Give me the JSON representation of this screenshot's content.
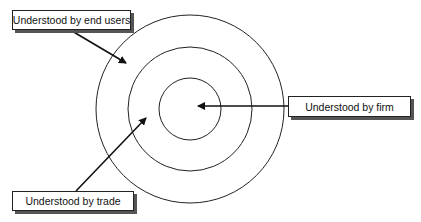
{
  "diagram": {
    "type": "concentric-circles",
    "center": [
      190,
      109
    ],
    "radii": [
      31,
      62,
      94
    ],
    "stroke_color": "#222222",
    "labels": [
      {
        "id": "end_users",
        "text": "Understood by end users",
        "target_ring": "outer"
      },
      {
        "id": "trade",
        "text": "Understood by trade",
        "target_ring": "middle"
      },
      {
        "id": "firm",
        "text": "Understood by firm",
        "target_ring": "inner"
      }
    ]
  }
}
